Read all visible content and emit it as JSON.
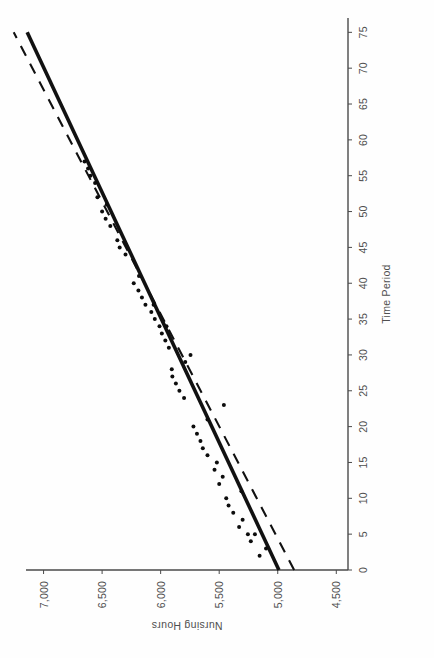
{
  "figure": {
    "background_color": "#ffffff",
    "ink_color": "#111111",
    "axis_color": "#4a4a4a",
    "label_color": "#4f4f4f",
    "rotation_degrees": -90,
    "orientation_note": "scanned page: chart rotated 90 degrees counter-clockwise"
  },
  "chart_data": {
    "type": "scatter",
    "title": "",
    "subtitle": "",
    "xlabel": "Time Period",
    "ylabel": "Nursing Hours",
    "xlim": [
      0,
      77
    ],
    "ylim": [
      4400,
      7150
    ],
    "grid": false,
    "legend": "none",
    "xticks": [
      0,
      5,
      10,
      15,
      20,
      25,
      30,
      35,
      40,
      45,
      50,
      55,
      60,
      65,
      70,
      75
    ],
    "xtick_labels": [
      "0",
      "5",
      "10",
      "15",
      "20",
      "25",
      "30",
      "35",
      "40",
      "45",
      "50",
      "55",
      "60",
      "65",
      "70",
      "75"
    ],
    "yticks": [
      4500,
      5000,
      5500,
      6000,
      6500,
      7000
    ],
    "ytick_labels": [
      "4,500",
      "5,000",
      "5,500",
      "6,000",
      "6,500",
      "7,000"
    ],
    "series": [
      {
        "name": "Observed nursing hours",
        "type": "scatter",
        "marker": "point",
        "color": "#0d0d0d",
        "points": [
          [
            2,
            5155
          ],
          [
            3,
            5100
          ],
          [
            4,
            5230
          ],
          [
            5,
            5255
          ],
          [
            5,
            5195
          ],
          [
            6,
            5330
          ],
          [
            7,
            5300
          ],
          [
            8,
            5380
          ],
          [
            9,
            5420
          ],
          [
            10,
            5440
          ],
          [
            11,
            5310
          ],
          [
            12,
            5500
          ],
          [
            13,
            5470
          ],
          [
            14,
            5540
          ],
          [
            15,
            5520
          ],
          [
            16,
            5600
          ],
          [
            17,
            5640
          ],
          [
            18,
            5660
          ],
          [
            19,
            5690
          ],
          [
            20,
            5720
          ],
          [
            21,
            5600
          ],
          [
            23,
            5460
          ],
          [
            24,
            5800
          ],
          [
            25,
            5840
          ],
          [
            26,
            5870
          ],
          [
            27,
            5900
          ],
          [
            28,
            5905
          ],
          [
            29,
            5790
          ],
          [
            30,
            5745
          ],
          [
            31,
            5930
          ],
          [
            32,
            5960
          ],
          [
            33,
            5990
          ],
          [
            34,
            6010
          ],
          [
            34,
            5950
          ],
          [
            35,
            6050
          ],
          [
            36,
            6080
          ],
          [
            37,
            6130
          ],
          [
            37,
            6060
          ],
          [
            38,
            6160
          ],
          [
            39,
            6190
          ],
          [
            40,
            6230
          ],
          [
            41,
            6185
          ],
          [
            44,
            6300
          ],
          [
            45,
            6350
          ],
          [
            46,
            6370
          ],
          [
            48,
            6430
          ],
          [
            49,
            6470
          ],
          [
            50,
            6500
          ],
          [
            51,
            6460
          ],
          [
            52,
            6540
          ],
          [
            54,
            6560
          ],
          [
            55,
            6600
          ],
          [
            56,
            6620
          ],
          [
            57,
            6650
          ]
        ]
      },
      {
        "name": "Fitted trend (solid)",
        "type": "line",
        "style": "solid",
        "color": "#111111",
        "endpoints": [
          [
            0,
            4990
          ],
          [
            75,
            7140
          ]
        ],
        "slope_per_period": 28.7,
        "intercept": 4990
      },
      {
        "name": "Alternate trend (dashed)",
        "type": "line",
        "style": "dashed",
        "color": "#111111",
        "endpoints": [
          [
            0,
            4860
          ],
          [
            75,
            7255
          ]
        ],
        "slope_per_period": 31.9,
        "intercept": 4860
      }
    ],
    "annotations": [
      {
        "text": "trend lines cross near time period 28",
        "x": 28,
        "y": 5900
      }
    ]
  }
}
